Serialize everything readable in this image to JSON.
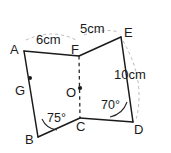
{
  "figure": {
    "background_color": "#ffffff",
    "stroke_color": "#1b1b1b",
    "guide_color": "#b9b9b9",
    "vertices": [
      {
        "name": "A",
        "label": "A",
        "x": 24,
        "y": 51,
        "label_x": 10,
        "label_y": 43
      },
      {
        "name": "B",
        "label": "B",
        "x": 38,
        "y": 137,
        "label_x": 25,
        "label_y": 133
      },
      {
        "name": "C",
        "label": "C",
        "x": 80,
        "y": 118,
        "label_x": 76,
        "label_y": 120
      },
      {
        "name": "D",
        "label": "D",
        "x": 133,
        "y": 122,
        "label_x": 134,
        "label_y": 123
      },
      {
        "name": "E",
        "label": "E",
        "x": 121,
        "y": 37,
        "label_x": 124,
        "label_y": 26
      },
      {
        "name": "F",
        "label": "F",
        "x": 79,
        "y": 56,
        "label_x": 71,
        "label_y": 43
      },
      {
        "name": "G",
        "label": "G",
        "x": 30,
        "y": 78,
        "label_x": 15,
        "label_y": 84
      },
      {
        "name": "O",
        "label": "O",
        "x": 80,
        "y": 88,
        "label_x": 66,
        "label_y": 86
      }
    ],
    "measurements": [
      {
        "name": "af-length",
        "text": "6cm",
        "x": 36,
        "y": 33
      },
      {
        "name": "fe-length",
        "text": "5cm",
        "x": 80,
        "y": 22
      },
      {
        "name": "ed-length",
        "text": "10cm",
        "x": 114,
        "y": 68
      }
    ],
    "angles": [
      {
        "name": "angle-at-b",
        "text": "75°",
        "x": 47,
        "y": 112
      },
      {
        "name": "angle-at-d",
        "text": "70°",
        "x": 101,
        "y": 99
      }
    ]
  }
}
